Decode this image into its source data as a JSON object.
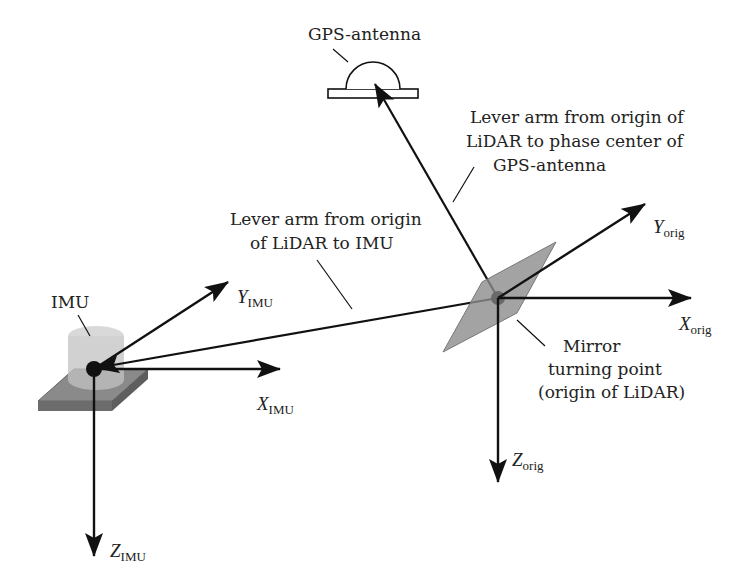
{
  "diagram": {
    "labels": {
      "gps_antenna": "GPS-antenna",
      "lever_gps": [
        "Lever arm from origin of",
        "LiDAR to phase center of",
        "GPS-antenna"
      ],
      "lever_imu": [
        "Lever arm from origin",
        "of LiDAR to IMU"
      ],
      "imu": "IMU",
      "mirror": [
        "Mirror",
        "turning point",
        "(origin of LiDAR)"
      ]
    },
    "axes": {
      "y_imu": {
        "main": "Y",
        "sub": "IMU"
      },
      "x_imu": {
        "main": "X",
        "sub": "IMU"
      },
      "z_imu": {
        "main": "Z",
        "sub": "IMU"
      },
      "y_orig": {
        "main": "Y",
        "sub": "orig"
      },
      "x_orig": {
        "main": "X",
        "sub": "orig"
      },
      "z_orig": {
        "main": "Z",
        "sub": "orig"
      }
    },
    "colors": {
      "line": "#111111",
      "mirror_fill": "#8c8c8c",
      "imu_plate": "#7a7a7a",
      "imu_cylinder": "#c4c4c4"
    }
  }
}
